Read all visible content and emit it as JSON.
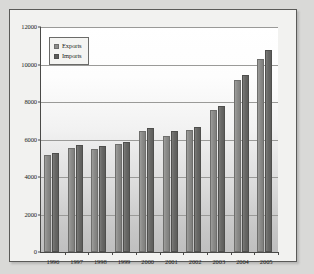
{
  "chart_data": {
    "type": "bar",
    "title": "",
    "subtitle": "",
    "xlabel": "",
    "ylabel": "",
    "categories": [
      "1996",
      "1997",
      "1998",
      "1999",
      "2000",
      "2001",
      "2002",
      "2003",
      "2004",
      "2005"
    ],
    "series": [
      {
        "name": "Exports",
        "color": "#8d8d8b",
        "values": [
          5150,
          5550,
          5500,
          5750,
          6450,
          6200,
          6500,
          7600,
          9200,
          10300
        ]
      },
      {
        "name": "Imports",
        "color": "#5d5d5b",
        "values": [
          5300,
          5700,
          5650,
          5850,
          6600,
          6450,
          6650,
          7800,
          9450,
          10750
        ]
      }
    ],
    "ylim": [
      0,
      12000
    ],
    "yticks": [
      0,
      2000,
      4000,
      6000,
      8000,
      10000,
      12000
    ],
    "ytick_labels": [
      "0",
      "2000",
      "4000",
      "6000",
      "8000",
      "10000",
      "12000"
    ],
    "grid": true,
    "legend": {
      "position": "top-left",
      "entries": [
        "Exports",
        "Imports"
      ]
    }
  }
}
